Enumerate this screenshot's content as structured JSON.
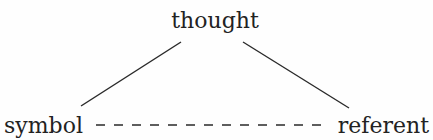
{
  "diagram": {
    "nodes": {
      "top": {
        "label": "thought"
      },
      "left": {
        "label": "symbol"
      },
      "right": {
        "label": "referent"
      }
    },
    "edges": [
      {
        "from": "symbol",
        "to": "thought",
        "style": "solid"
      },
      {
        "from": "thought",
        "to": "referent",
        "style": "solid"
      },
      {
        "from": "symbol",
        "to": "referent",
        "style": "dashed"
      }
    ],
    "colors": {
      "line": "#2a2a2a",
      "text": "#222222",
      "background": "#fefefe"
    }
  }
}
